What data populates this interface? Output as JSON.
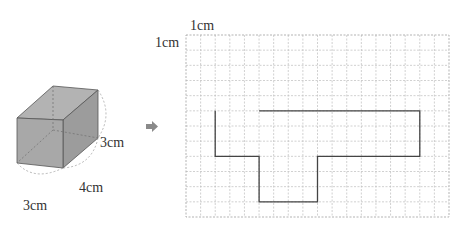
{
  "cuboid": {
    "labels": {
      "height": "3cm",
      "depth": "4cm",
      "width": "3cm"
    },
    "dimensions_cm": {
      "width": 3,
      "depth": 4,
      "height": 3
    },
    "colors": {
      "face": "#a9a9a9",
      "top": "#b5b5b5",
      "side": "#9e9e9e",
      "edge": "#555555",
      "hidden": "#777777"
    }
  },
  "arrow": {
    "icon": "right-arrow-icon",
    "color": "#8a8a8a"
  },
  "grid": {
    "unit_label_top": "1cm",
    "unit_label_left": "1cm",
    "columns": 18,
    "rows": 12,
    "line_color": "#b8b8b8"
  },
  "net_shape": {
    "description": "Partial net outline on 1cm grid (grid units from top-left)",
    "path_units": [
      [
        5,
        5
      ],
      [
        16,
        5
      ],
      [
        16,
        8
      ],
      [
        9,
        8
      ],
      [
        9,
        11
      ],
      [
        5,
        11
      ],
      [
        5,
        8
      ],
      [
        2,
        8
      ],
      [
        2,
        5
      ]
    ],
    "stroke_color": "#444444"
  }
}
